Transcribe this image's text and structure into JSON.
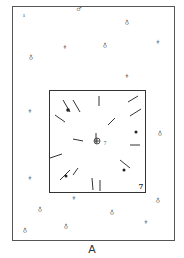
{
  "figure": {
    "label": "A",
    "corner_label": "7",
    "center_label": "7"
  },
  "markers": [
    {
      "x": 24,
      "y": 15,
      "glyph": "ı",
      "sub": "1"
    },
    {
      "x": 79,
      "y": 9,
      "glyph": "♂",
      "sub": ""
    },
    {
      "x": 127,
      "y": 22,
      "glyph": "♁",
      "sub": ""
    },
    {
      "x": 31,
      "y": 57,
      "glyph": "♁",
      "sub": ""
    },
    {
      "x": 65,
      "y": 47,
      "glyph": "ǂ",
      "sub": ""
    },
    {
      "x": 105,
      "y": 45,
      "glyph": "♁",
      "sub": ""
    },
    {
      "x": 158,
      "y": 42,
      "glyph": "ǂ",
      "sub": ""
    },
    {
      "x": 127,
      "y": 76,
      "glyph": "ǂ",
      "sub": ""
    },
    {
      "x": 30,
      "y": 111,
      "glyph": "ǂ",
      "sub": ""
    },
    {
      "x": 160,
      "y": 133,
      "glyph": "♁",
      "sub": ""
    },
    {
      "x": 30,
      "y": 178,
      "glyph": "ǂ",
      "sub": ""
    },
    {
      "x": 74,
      "y": 198,
      "glyph": "ǂ",
      "sub": ""
    },
    {
      "x": 158,
      "y": 200,
      "glyph": "♁",
      "sub": ""
    },
    {
      "x": 40,
      "y": 209,
      "glyph": "♁",
      "sub": ""
    },
    {
      "x": 112,
      "y": 212,
      "glyph": "♁",
      "sub": ""
    },
    {
      "x": 146,
      "y": 222,
      "glyph": "ǂ",
      "sub": ""
    },
    {
      "x": 25,
      "y": 230,
      "glyph": "♁",
      "sub": ""
    },
    {
      "x": 66,
      "y": 226,
      "glyph": "♁",
      "sub": ""
    }
  ]
}
